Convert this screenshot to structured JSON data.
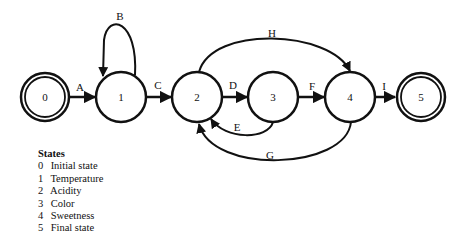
{
  "diagram": {
    "type": "state-transition",
    "nodes": [
      {
        "id": "0",
        "label": "0",
        "x": 45,
        "y": 97,
        "double": true
      },
      {
        "id": "1",
        "label": "1",
        "x": 121,
        "y": 97,
        "double": false
      },
      {
        "id": "2",
        "label": "2",
        "x": 197,
        "y": 97,
        "double": false
      },
      {
        "id": "3",
        "label": "3",
        "x": 273,
        "y": 97,
        "double": false
      },
      {
        "id": "4",
        "label": "4",
        "x": 350,
        "y": 97,
        "double": false
      },
      {
        "id": "5",
        "label": "5",
        "x": 421,
        "y": 97,
        "double": true
      }
    ],
    "edges": [
      {
        "label": "A",
        "from": "0",
        "to": "1"
      },
      {
        "label": "B",
        "from": "1",
        "to": "1"
      },
      {
        "label": "C",
        "from": "1",
        "to": "2"
      },
      {
        "label": "D",
        "from": "2",
        "to": "3"
      },
      {
        "label": "E",
        "from": "3",
        "to": "2"
      },
      {
        "label": "F",
        "from": "3",
        "to": "4"
      },
      {
        "label": "G",
        "from": "4",
        "to": "2"
      },
      {
        "label": "H",
        "from": "2",
        "to": "4"
      },
      {
        "label": "I",
        "from": "4",
        "to": "5"
      }
    ]
  },
  "legend": {
    "title": "States",
    "items": [
      {
        "num": "0",
        "text": "Initial state"
      },
      {
        "num": "1",
        "text": "Temperature"
      },
      {
        "num": "2",
        "text": "Acidity"
      },
      {
        "num": "3",
        "text": "Color"
      },
      {
        "num": "4",
        "text": "Sweetness"
      },
      {
        "num": "5",
        "text": "Final state"
      }
    ]
  }
}
